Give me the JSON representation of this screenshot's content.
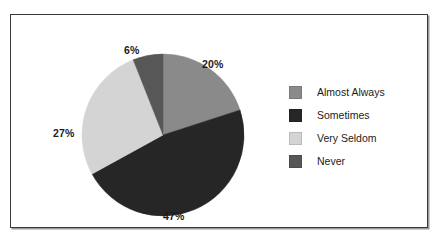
{
  "chart_data": {
    "type": "pie",
    "title": "",
    "subtitle": "",
    "xlabel": "",
    "ylabel": "",
    "grid": false,
    "legend_position": "right",
    "start_angle_deg": 0,
    "direction": "clockwise",
    "categories": [
      "Almost Always",
      "Sometimes",
      "Very Seldom",
      "Never"
    ],
    "values": [
      20,
      47,
      27,
      6
    ],
    "value_unit": "%",
    "data_labels": [
      "20%",
      "47%",
      "27%",
      "6%"
    ],
    "colors": [
      "#8a8a8a",
      "#262626",
      "#d4d4d4",
      "#575757"
    ],
    "slices": [
      {
        "label": "Almost Always",
        "value": 20,
        "data_label": "20%",
        "color": "#8a8a8a"
      },
      {
        "label": "Sometimes",
        "value": 47,
        "data_label": "47%",
        "color": "#262626"
      },
      {
        "label": "Very Seldom",
        "value": 27,
        "data_label": "27%",
        "color": "#d4d4d4"
      },
      {
        "label": "Never",
        "value": 6,
        "data_label": "6%",
        "color": "#575757"
      }
    ]
  },
  "legend": {
    "items": [
      {
        "label": "Almost Always",
        "color": "#8a8a8a"
      },
      {
        "label": "Sometimes",
        "color": "#262626"
      },
      {
        "label": "Very Seldom",
        "color": "#d4d4d4"
      },
      {
        "label": "Never",
        "color": "#575757"
      }
    ]
  },
  "frame": {
    "background": "#ffffff",
    "border_color": "#3a3a3a"
  }
}
